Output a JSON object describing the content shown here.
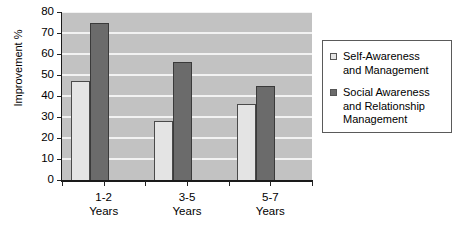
{
  "chart_data": {
    "type": "bar",
    "title": "",
    "subtitle": "",
    "xlabel": "",
    "ylabel": "Improvement %",
    "categories": [
      "1-2 Years",
      "3-5 Years",
      "5-7 Years"
    ],
    "category_lines": [
      {
        "line1": "1-2",
        "line2": "Years"
      },
      {
        "line1": "3-5",
        "line2": "Years"
      },
      {
        "line1": "5-7",
        "line2": "Years"
      }
    ],
    "series": [
      {
        "name": "Self-Awareness and Management",
        "legend_label": "Self-Awareness\nand Management",
        "color": "#e4e4e4",
        "values": [
          47,
          28,
          36
        ]
      },
      {
        "name": "Social  Awareness and Relationship Management",
        "legend_label": "Social  Awareness\nand Relationship\nManagement",
        "color": "#6b6b6b",
        "values": [
          75,
          56,
          45
        ]
      }
    ],
    "ylim": [
      0,
      80
    ],
    "ytick_values": [
      0,
      10,
      20,
      30,
      40,
      50,
      60,
      70,
      80
    ],
    "ytick_labels": [
      "0",
      "10",
      "20",
      "30",
      "40",
      "50",
      "60",
      "70",
      "80"
    ],
    "grid": true,
    "grid_color": "#f2f2f2",
    "plot_background": "#c2c2c2",
    "legend_position": "right-outside",
    "legend_border_color": "#5a5a5a"
  }
}
